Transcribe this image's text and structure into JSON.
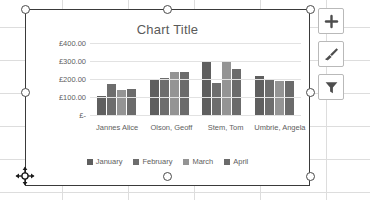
{
  "chart_data": {
    "type": "bar",
    "title": "Chart Title",
    "xlabel": "",
    "ylabel": "",
    "ylim": [
      0,
      400
    ],
    "yticks": [
      0,
      100,
      200,
      300,
      400
    ],
    "ytick_labels": [
      "£-",
      "£100.00",
      "£200.00",
      "£300.00",
      "£400.00"
    ],
    "grid": true,
    "legend_position": "bottom",
    "categories": [
      "Jannes Alice",
      "Olson, Geoff",
      "Stem, Tom",
      "Umbrie, Angela"
    ],
    "series": [
      {
        "name": "January",
        "color": "#5f5f5f",
        "values": [
          105,
          200,
          295,
          218
        ]
      },
      {
        "name": "February",
        "color": "#6d6d6d",
        "values": [
          170,
          208,
          180,
          197
        ]
      },
      {
        "name": "March",
        "color": "#949494",
        "values": [
          138,
          240,
          292,
          188
        ]
      },
      {
        "name": "April",
        "color": "#6b6b6b",
        "values": [
          145,
          240,
          258,
          188
        ]
      }
    ]
  },
  "chart_buttons": [
    {
      "name": "chart-elements",
      "glyph": "+"
    },
    {
      "name": "chart-styles",
      "glyph": "brush"
    },
    {
      "name": "chart-filters",
      "glyph": "funnel"
    }
  ]
}
